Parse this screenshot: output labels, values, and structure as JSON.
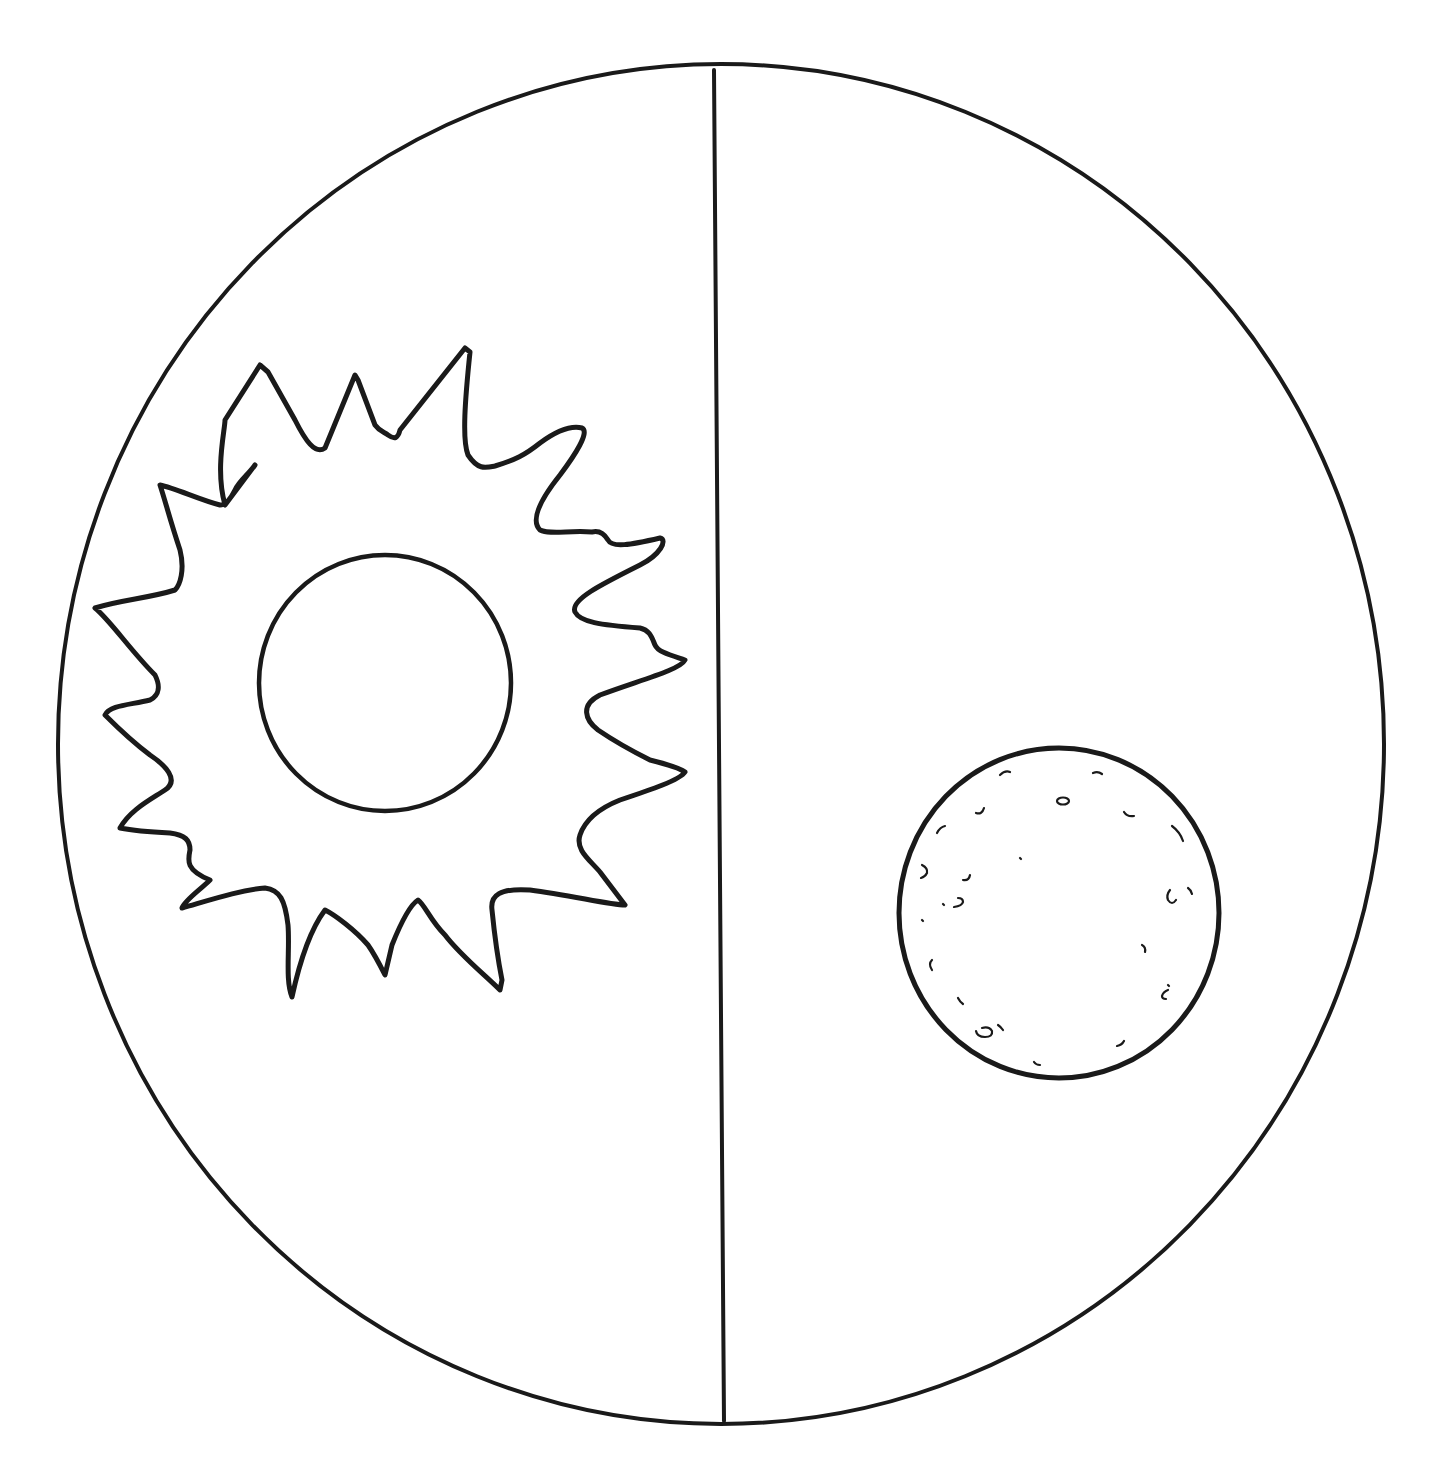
{
  "diagram": {
    "kind": "day-night coloring diagram",
    "panels": [
      {
        "side": "left",
        "subject": "sun",
        "label": ""
      },
      {
        "side": "right",
        "subject": "moon",
        "label": ""
      }
    ],
    "colors": {
      "stroke": "#1a1a1a",
      "background": "#ffffff"
    }
  },
  "icons": {
    "sun": "sun-icon",
    "moon": "moon-icon"
  }
}
